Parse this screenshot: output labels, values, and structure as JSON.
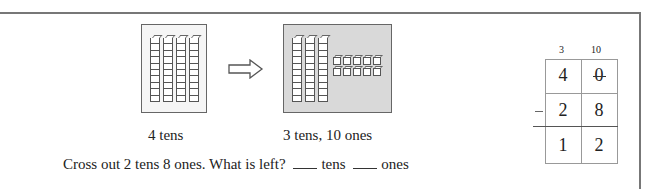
{
  "figure": {
    "left_model": {
      "label": "4 tens",
      "tens_rods": 4,
      "ones_cubes": 0
    },
    "arrow": "right-outline-arrow",
    "right_model": {
      "label": "3 tens, 10 ones",
      "tens_rods": 3,
      "ones_cubes": 10
    },
    "question": {
      "prefix": "Cross out 2 tens 8 ones. What is left?",
      "blank1_unit": "tens",
      "blank2_unit": "ones"
    }
  },
  "subtraction": {
    "regroup_marks": {
      "tens": "3",
      "ones": "10"
    },
    "rows": [
      {
        "tens": "4",
        "ones": "0",
        "tens_crossed": false,
        "ones_crossed": true
      },
      {
        "operator": "−",
        "tens": "2",
        "ones": "8"
      },
      {
        "tens": "1",
        "ones": "2"
      }
    ]
  }
}
